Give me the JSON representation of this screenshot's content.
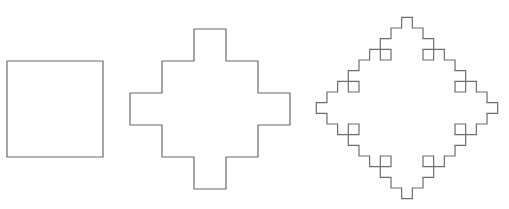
{
  "diagram": {
    "title": "",
    "stroke_color": "#6b6b6b",
    "background": "#ffffff",
    "figures": [
      {
        "name": "iteration-0-square",
        "iteration": 0,
        "origin": [
          7,
          61
        ],
        "side": 96,
        "orientation": "axis-aligned"
      },
      {
        "name": "iteration-1-cross",
        "iteration": 1,
        "center": [
          210,
          109
        ],
        "unit": 32
      },
      {
        "name": "iteration-2-fractal",
        "iteration": 2,
        "center": [
          407,
          108
        ],
        "unit": 10.67
      }
    ],
    "generator_rule": "each segment of length 3 units replaced by: 1 along, 1 outward, 1 along, 1 inward, 1 along"
  }
}
